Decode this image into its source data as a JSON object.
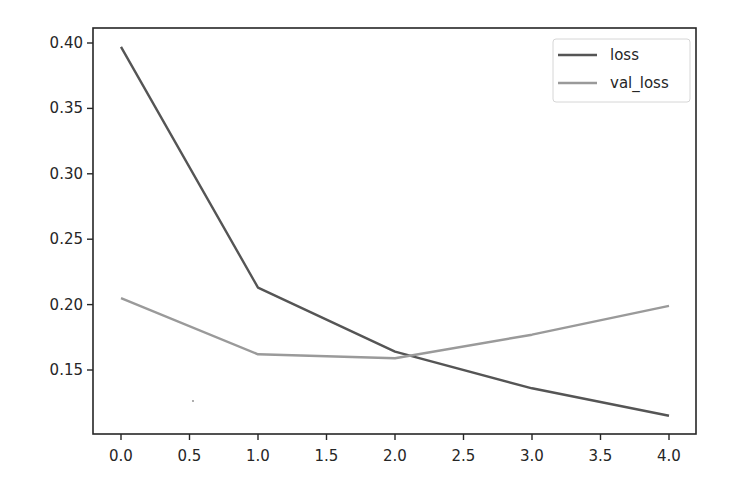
{
  "chart_data": {
    "type": "line",
    "title": "",
    "xlabel": "",
    "ylabel": "",
    "x": [
      0,
      1,
      2,
      3,
      4
    ],
    "series": [
      {
        "name": "loss",
        "values": [
          0.397,
          0.213,
          0.164,
          0.136,
          0.115
        ],
        "color": "#555555"
      },
      {
        "name": "val_loss",
        "values": [
          0.205,
          0.162,
          0.159,
          0.177,
          0.199
        ],
        "color": "#9a9a9a"
      }
    ],
    "xlim": [
      -0.2,
      4.2
    ],
    "ylim": [
      0.1,
      0.412
    ],
    "xticks": [
      0.0,
      0.5,
      1.0,
      1.5,
      2.0,
      2.5,
      3.0,
      3.5,
      4.0
    ],
    "xtick_labels": [
      "0.0",
      "0.5",
      "1.0",
      "1.5",
      "2.0",
      "2.5",
      "3.0",
      "3.5",
      "4.0"
    ],
    "yticks": [
      0.15,
      0.2,
      0.25,
      0.3,
      0.35,
      0.4
    ],
    "ytick_labels": [
      "0.15",
      "0.20",
      "0.25",
      "0.30",
      "0.35",
      "0.40"
    ],
    "grid": false,
    "legend_position": "upper right"
  }
}
